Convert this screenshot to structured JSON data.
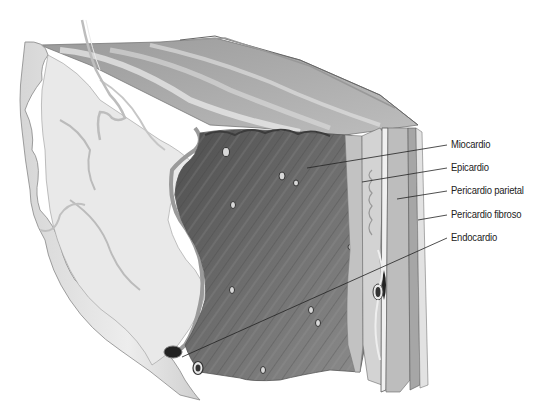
{
  "figure": {
    "labels": [
      {
        "text": "Miocardio",
        "y": 145,
        "target": [
          307,
          168
        ]
      },
      {
        "text": "Epicardio",
        "y": 168,
        "target": [
          362,
          182
        ]
      },
      {
        "text": "Pericardio parietal",
        "y": 191,
        "target": [
          397,
          199
        ]
      },
      {
        "text": "Pericardio fibroso",
        "y": 215,
        "target": [
          418,
          220
        ]
      },
      {
        "text": "Endocardio",
        "y": 238,
        "target": [
          182,
          357
        ]
      }
    ],
    "colors": {
      "background": "#ffffff",
      "myocardium_dark": "#5a5a5a",
      "myocardium_mid": "#8a8a8a",
      "endocardium_light": "#e4e4e4",
      "layers": "#c8c8c8",
      "leader_line": "#222222",
      "label_text": "#222222"
    }
  }
}
